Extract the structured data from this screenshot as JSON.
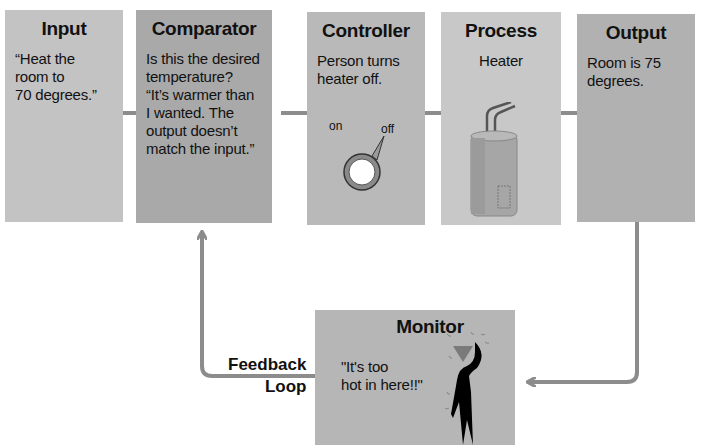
{
  "diagram": {
    "type": "feedback-control-loop",
    "stages": [
      {
        "id": "input",
        "title": "Input",
        "body": "“Heat the\nroom to\n70 degrees.”"
      },
      {
        "id": "comparator",
        "title": "Comparator",
        "body": "Is this the desired\ntemperature?\n“It’s warmer than\nI wanted. The\noutput doesn’t\nmatch the input.”"
      },
      {
        "id": "controller",
        "title": "Controller",
        "body": "Person turns\nheater off.",
        "knob": {
          "on_label": "on",
          "off_label": "off",
          "icon": "dial-knob-icon"
        }
      },
      {
        "id": "process",
        "title": "Process",
        "body": "Heater",
        "icon": "water-heater-icon"
      },
      {
        "id": "output",
        "title": "Output",
        "body": "Room is 75\ndegrees."
      }
    ],
    "monitor": {
      "title": "Monitor",
      "body": "\"It's too\nhot in here!!\"",
      "icon": "sweating-person-icon"
    },
    "feedback_label": "Feedback\nLoop",
    "colors": {
      "arrow": "#8c8c8c",
      "input_box": "#c3c3c3",
      "comparator_box": "#a9a9a9",
      "controller_box": "#b9b9b9",
      "process_box": "#c8c8c8",
      "output_box": "#b1b1b1",
      "monitor_box": "#b6b6b6",
      "person_head": "#7a7a7a",
      "person_body": "#000000"
    }
  }
}
